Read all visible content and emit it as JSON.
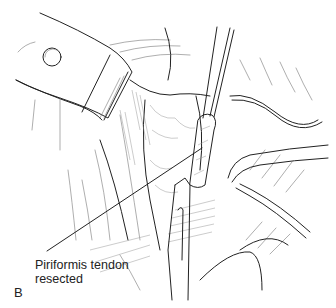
{
  "figure": {
    "panel_label": "B",
    "annotation": {
      "line1": "Piriformis tendon",
      "line2": "resected"
    },
    "colors": {
      "ink": "#222222",
      "background": "#ffffff"
    }
  }
}
